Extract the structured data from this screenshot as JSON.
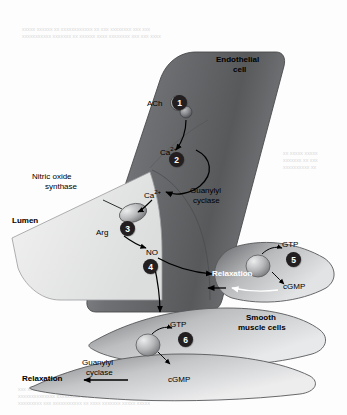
{
  "figure": {
    "labels": {
      "endothelial_cell_line1": "Endothelial",
      "endothelial_cell_line2": "cell",
      "ach": "ACh",
      "calcium_1": "Ca2+",
      "calcium_2": "Ca2+",
      "nitric_oxide_synthase_line1": "Nitric oxide",
      "nitric_oxide_synthase_line2": "synthase",
      "guanylyl_cyclase_top_line1": "Guanylyl",
      "guanylyl_cyclase_top_line2": "cyclase",
      "guanylyl_cyclase_bottom_line1": "Guanylyl",
      "guanylyl_cyclase_bottom_line2": "cyclase",
      "lumen": "Lumen",
      "arg": "Arg",
      "no": "NO",
      "gtp_top": "GTP",
      "gtp_bottom": "GTP",
      "cgmp_top": "cGMP",
      "cgmp_bottom": "cGMP",
      "relaxation_top": "Relaxation",
      "relaxation_bottom": "Relaxation",
      "smooth_muscle_line1": "Smooth",
      "smooth_muscle_line2": "muscle cells"
    },
    "steps": [
      "1",
      "2",
      "3",
      "4",
      "5",
      "6"
    ],
    "colors": {
      "cell_dark": "#6d6e71",
      "cell_mid": "#a7a9ac",
      "cell_light": "#e6e7e8",
      "marker_fill": "#231f20",
      "marker_text": "#ffffff",
      "outline": "#58595b"
    }
  },
  "page_bleed": {
    "top_line1": "xxxxx xxxxxx xx xxxxxxxxxxxx xx xxx xxxxxxxx xxx xxx",
    "top_line2": "xxxxxxxxxxx xxxxxxx xx xxxxxx xxxx xxxxxxxx xxx xxx xxxx",
    "right_line1": "xx xxxxx xxxxx",
    "right_line2": "xxxxxxx xx xxx",
    "right_line3": "xxxxxxxxxx xx",
    "bottom_line1": "xxx xxxxxxxxx xxxxxx xx xxxxxxxxx xx xxxx xxxxx",
    "bottom_line2": "xxxxxxxxxxxxxx xxxxxxxxx xx xxxxxx xxxxxxxxxx xxx",
    "bottom_line3": "xxxxxxxxx xxx xxxxxxxxxxx xx xxxx xxxxxxx xxxxx xxxxx"
  }
}
